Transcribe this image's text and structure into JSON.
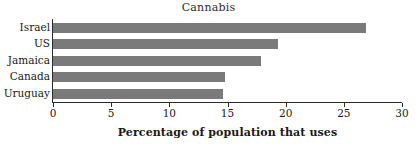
{
  "chart_data": {
    "type": "bar",
    "orientation": "horizontal",
    "title": "Cannabis",
    "xlabel": "Percentage of population that uses",
    "ylabel": "",
    "categories": [
      "Israel",
      "US",
      "Jamaica",
      "Canada",
      "Uruguay"
    ],
    "values": [
      26.9,
      19.3,
      17.9,
      14.8,
      14.6
    ],
    "xlim": [
      0,
      30
    ],
    "xticks": [
      0,
      5,
      10,
      15,
      20,
      25,
      30
    ],
    "xtick_labels": [
      "0",
      "5",
      "10",
      "15",
      "20",
      "25",
      "30"
    ],
    "grid": false,
    "legend": null,
    "bar_color": "#7a7a7a",
    "axis_color": "#2b2b2b",
    "background_color": "#ffffff"
  }
}
